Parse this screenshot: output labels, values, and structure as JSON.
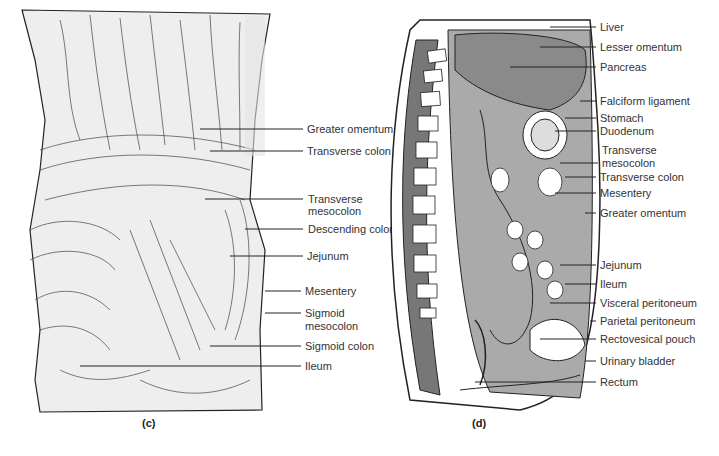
{
  "panel_c": {
    "caption": "(c)",
    "labels": [
      {
        "text": "Greater omentum",
        "x": 307,
        "y": 123
      },
      {
        "text": "Transverse colon",
        "x": 307,
        "y": 145
      },
      {
        "text": "Transverse",
        "x": 308,
        "y": 193
      },
      {
        "text": "mesocolon",
        "x": 308,
        "y": 205
      },
      {
        "text": "Descending colon",
        "x": 308,
        "y": 223
      },
      {
        "text": "Jejunum",
        "x": 307,
        "y": 250
      },
      {
        "text": "Mesentery",
        "x": 305,
        "y": 285
      },
      {
        "text": "Sigmoid",
        "x": 305,
        "y": 307
      },
      {
        "text": "mesocolon",
        "x": 305,
        "y": 320
      },
      {
        "text": "Sigmoid colon",
        "x": 305,
        "y": 340
      },
      {
        "text": "Ileum",
        "x": 305,
        "y": 360
      }
    ]
  },
  "panel_d": {
    "caption": "(d)",
    "labels": [
      {
        "text": "Liver",
        "x": 600,
        "y": 21
      },
      {
        "text": "Lesser omentum",
        "x": 600,
        "y": 41
      },
      {
        "text": "Pancreas",
        "x": 600,
        "y": 61
      },
      {
        "text": "Falciform ligament",
        "x": 600,
        "y": 95
      },
      {
        "text": "Stomach",
        "x": 600,
        "y": 112
      },
      {
        "text": "Duodenum",
        "x": 600,
        "y": 125
      },
      {
        "text": "Transverse",
        "x": 602,
        "y": 144
      },
      {
        "text": "mesocolon",
        "x": 602,
        "y": 157
      },
      {
        "text": "Transverse colon",
        "x": 600,
        "y": 171
      },
      {
        "text": "Mesentery",
        "x": 600,
        "y": 187
      },
      {
        "text": "Greater omentum",
        "x": 600,
        "y": 207
      },
      {
        "text": "Jejunum",
        "x": 600,
        "y": 259
      },
      {
        "text": "Ileum",
        "x": 600,
        "y": 278
      },
      {
        "text": "Visceral peritoneum",
        "x": 600,
        "y": 297
      },
      {
        "text": "Parietal peritoneum",
        "x": 600,
        "y": 315
      },
      {
        "text": "Rectovesical pouch",
        "x": 600,
        "y": 333
      },
      {
        "text": "Urinary bladder",
        "x": 600,
        "y": 355
      },
      {
        "text": "Rectum",
        "x": 600,
        "y": 376
      }
    ]
  }
}
